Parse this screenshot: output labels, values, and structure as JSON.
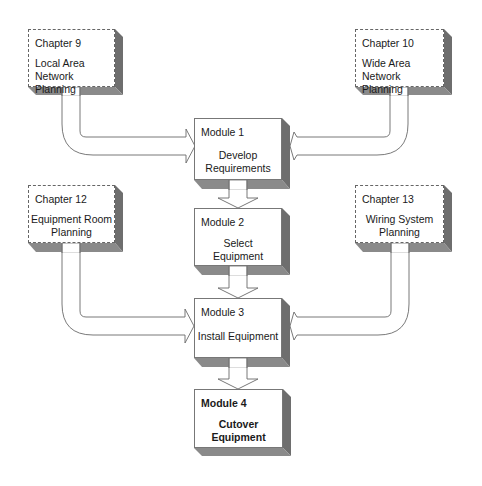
{
  "diagram": {
    "type": "flowchart",
    "chapters": [
      {
        "id": "ch9",
        "title": "Chapter 9",
        "body": [
          "Local Area",
          "Network Planning"
        ],
        "target": "m1"
      },
      {
        "id": "ch10",
        "title": "Chapter 10",
        "body": [
          "Wide Area",
          "Network Planning"
        ],
        "target": "m1"
      },
      {
        "id": "ch12",
        "title": "Chapter 12",
        "body": [
          "Equipment Room",
          "Planning"
        ],
        "target": "m3"
      },
      {
        "id": "ch13",
        "title": "Chapter 13",
        "body": [
          "Wiring System",
          "Planning"
        ],
        "target": "m3"
      }
    ],
    "modules": [
      {
        "id": "m1",
        "title": "Module 1",
        "body": [
          "Develop",
          "Requirements"
        ]
      },
      {
        "id": "m2",
        "title": "Module 2",
        "body": [
          "Select",
          "Equipment"
        ]
      },
      {
        "id": "m3",
        "title": "Module 3",
        "body": [
          "Install Equipment"
        ]
      },
      {
        "id": "m4",
        "title": "Module 4",
        "body": [
          "Cutover",
          "Equipment"
        ],
        "bold": true
      }
    ],
    "flow": [
      "m1",
      "m2",
      "m3",
      "m4"
    ],
    "colors": {
      "box_fill": "#ffffff",
      "shadow_side": "#6e6e6e",
      "shadow_bottom": "#8a8a8a",
      "outline": "#777777",
      "arrow_fill": "#ffffff"
    }
  }
}
